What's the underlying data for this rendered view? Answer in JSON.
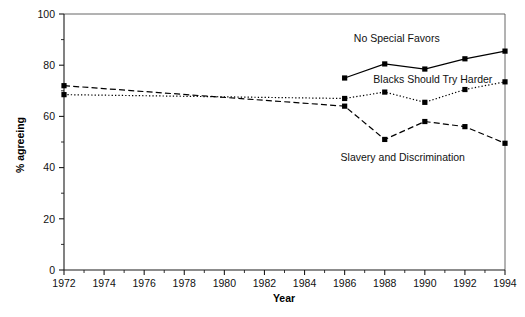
{
  "chart_data": {
    "type": "line",
    "title": "",
    "xlabel": "Year",
    "ylabel": "% agreeing",
    "xlim": [
      1972,
      1994
    ],
    "ylim": [
      0,
      100
    ],
    "grid": false,
    "legend_position": "inline-annotations",
    "x_tick_labels": [
      "1972",
      "1974",
      "1976",
      "1978",
      "1980",
      "1982",
      "1984",
      "1986",
      "1988",
      "1990",
      "1992",
      "1994"
    ],
    "x_tick_values": [
      1972,
      1974,
      1976,
      1978,
      1980,
      1982,
      1984,
      1986,
      1988,
      1990,
      1992,
      1994
    ],
    "x_minor_ticks": [
      1973,
      1975,
      1977,
      1979,
      1981,
      1983,
      1985,
      1987,
      1989,
      1991,
      1993
    ],
    "y_tick_labels": [
      "0",
      "20",
      "40",
      "60",
      "80",
      "100"
    ],
    "y_tick_values": [
      0,
      20,
      40,
      60,
      80,
      100
    ],
    "y_minor_ticks": [
      10,
      30,
      50,
      70,
      90
    ],
    "series": [
      {
        "name": "No Special Favors",
        "line_style": "solid",
        "marker": "square",
        "x": [
          1986,
          1988,
          1990,
          1992,
          1994
        ],
        "values": [
          75.0,
          80.5,
          78.5,
          82.5,
          85.5
        ]
      },
      {
        "name": "Blacks Should Try Harder",
        "line_style": "dotted",
        "marker": "square",
        "x": [
          1972,
          1986,
          1988,
          1990,
          1992,
          1994
        ],
        "values": [
          68.5,
          67.0,
          69.5,
          65.5,
          70.5,
          73.5
        ]
      },
      {
        "name": "Slavery and Discrimination",
        "line_style": "dashed",
        "marker": "square",
        "x": [
          1972,
          1986,
          1988,
          1990,
          1992,
          1994
        ],
        "values": [
          72.0,
          64.0,
          51.0,
          58.0,
          56.0,
          49.5
        ]
      }
    ],
    "annotations": [
      {
        "text": "No Special Favors",
        "x": 1988.6,
        "y": 89.0
      },
      {
        "text": "Blacks Should Try Harder",
        "x": 1990.4,
        "y": 73.2
      },
      {
        "text": "Slavery and Discrimination",
        "x": 1988.9,
        "y": 42.5
      }
    ],
    "colors": {
      "line": "#000000",
      "marker": "#000000",
      "axis": "#1a1a1a",
      "frame": "#555555",
      "background": "#ffffff"
    }
  }
}
